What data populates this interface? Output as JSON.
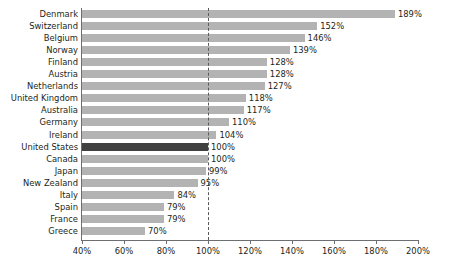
{
  "chart_data": {
    "type": "bar",
    "orientation": "horizontal",
    "title": "",
    "subtitle": "",
    "xlabel": "",
    "ylabel": "",
    "xlim": [
      40,
      200
    ],
    "xticks": [
      40,
      60,
      80,
      100,
      120,
      140,
      160,
      180,
      200
    ],
    "xtick_labels": [
      "40%",
      "60%",
      "80%",
      "100%",
      "120%",
      "140%",
      "160%",
      "180%",
      "200%"
    ],
    "grid": false,
    "legend": null,
    "value_suffix": "%",
    "reference_line": {
      "value": 100,
      "style": "dashed",
      "label": ""
    },
    "categories": [
      "Denmark",
      "Switzerland",
      "Belgium",
      "Norway",
      "Finland",
      "Austria",
      "Netherlands",
      "United Kingdom",
      "Australia",
      "Germany",
      "Ireland",
      "United States",
      "Canada",
      "Japan",
      "New Zealand",
      "Italy",
      "Spain",
      "France",
      "Greece"
    ],
    "values": [
      189,
      152,
      146,
      139,
      128,
      128,
      127,
      118,
      117,
      110,
      104,
      100,
      100,
      99,
      95,
      84,
      79,
      79,
      70
    ],
    "data_labels": [
      "189%",
      "152%",
      "146%",
      "139%",
      "128%",
      "128%",
      "127%",
      "118%",
      "117%",
      "110%",
      "104%",
      "100%",
      "100%",
      "99%",
      "95%",
      "84%",
      "79%",
      "79%",
      "70%"
    ],
    "highlighted_category": "United States"
  },
  "colors": {
    "bar": "#b3b3b3",
    "bar_highlight": "#404040",
    "axis": "#6d6e71",
    "reference_line": "#58595b",
    "text": "#231f20",
    "background": "#ffffff"
  }
}
